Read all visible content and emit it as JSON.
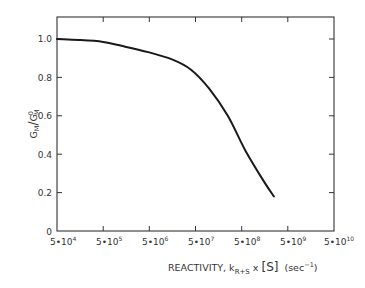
{
  "chart_data": {
    "type": "line",
    "title": "",
    "xlabel": "REACTIVITY, k_R+S x [S] (sec^-1)",
    "ylabel": "G_M / G_M^0",
    "xscale": "log",
    "xlim": [
      50000,
      50000000000
    ],
    "ylim": [
      0,
      1.1
    ],
    "grid": false,
    "legend": null,
    "x_ticks": [
      "5•10^4",
      "5•10^5",
      "5•10^6",
      "5•10^7",
      "5•10^8",
      "5•10^9",
      "5•10^10"
    ],
    "x_tick_values": [
      50000,
      500000,
      5000000,
      50000000,
      500000000,
      5000000000,
      50000000000
    ],
    "y_ticks": [
      "0",
      "0.2",
      "0.4",
      "0.6",
      "0.8",
      "1.0"
    ],
    "y_tick_values": [
      0,
      0.2,
      0.4,
      0.6,
      0.8,
      1.0
    ],
    "series": [
      {
        "name": "G_M/G_M^0",
        "x": [
          50000,
          150000,
          500000,
          1500000,
          5000000,
          15000000,
          40000000,
          100000000,
          250000000,
          600000000,
          1500000000,
          2500000000
        ],
        "y": [
          1.0,
          0.995,
          0.985,
          0.96,
          0.93,
          0.895,
          0.84,
          0.74,
          0.6,
          0.42,
          0.26,
          0.18
        ]
      }
    ]
  },
  "labels": {
    "y_axis_main": "G",
    "y_axis_sub1": "M",
    "y_axis_slash": "/",
    "y_axis_sup": "0",
    "y_axis_sub2": "M",
    "x_axis_prefix": "REACTIVITY,  k",
    "x_axis_sub": "R+S",
    "x_axis_mid": " x ",
    "x_axis_bracket": "[S]",
    "x_axis_unit_pre": "(sec",
    "x_axis_unit_sup": "−1",
    "x_axis_unit_post": ")"
  },
  "ticks": {
    "x": [
      {
        "base": "5•10",
        "exp": "4"
      },
      {
        "base": "5•10",
        "exp": "5"
      },
      {
        "base": "5•10",
        "exp": "6"
      },
      {
        "base": "5•10",
        "exp": "7"
      },
      {
        "base": "5•10",
        "exp": "8"
      },
      {
        "base": "5•10",
        "exp": "9"
      },
      {
        "base": "5•10",
        "exp": "10"
      }
    ],
    "y": [
      "0",
      "0.2",
      "0.4",
      "0.6",
      "0.8",
      "1.0"
    ]
  }
}
